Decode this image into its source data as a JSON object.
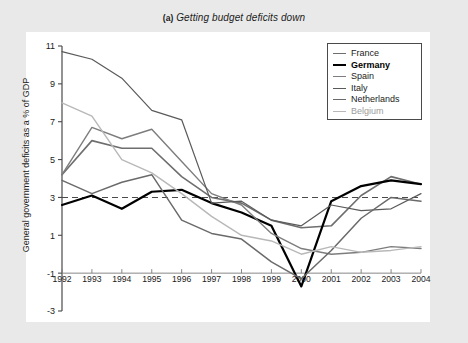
{
  "figure": {
    "panel_label": "(a)",
    "title": "Getting budget deficits down",
    "background_color": "#e9e9e9",
    "plot_background_color": "#ffffff"
  },
  "legend": {
    "position": "top-right",
    "entries": [
      {
        "label": "France",
        "color": "#6e6e6e",
        "width": 1.6,
        "icon": "line-swatch-icon"
      },
      {
        "label": "Germany",
        "color": "#000000",
        "width": 2.2,
        "icon": "line-swatch-icon"
      },
      {
        "label": "Spain",
        "color": "#7d7d7d",
        "width": 1.4,
        "icon": "line-swatch-icon"
      },
      {
        "label": "Italy",
        "color": "#5a5a5a",
        "width": 1.2,
        "icon": "line-swatch-icon"
      },
      {
        "label": "Netherlands",
        "color": "#6a6a6a",
        "width": 1.5,
        "icon": "line-swatch-icon"
      },
      {
        "label": "Belgium",
        "color": "#b8b8b8",
        "width": 1.4,
        "icon": "line-swatch-icon"
      }
    ]
  },
  "chart_data": {
    "type": "line",
    "title": "(a)  Getting budget deficits down",
    "xlabel": "",
    "ylabel": "General government deficits as a % of GDP",
    "x": [
      1992,
      1993,
      1994,
      1995,
      1996,
      1997,
      1998,
      1999,
      2000,
      2001,
      2002,
      2003,
      2004
    ],
    "xtick_labels": [
      "1992",
      "1993",
      "1994",
      "1995",
      "1996",
      "1997",
      "1998",
      "1999",
      "2000",
      "2001",
      "2002",
      "2003",
      "2004"
    ],
    "ytick_labels": [
      "11",
      "9",
      "7",
      "5",
      "3",
      "1",
      "-1",
      "-3"
    ],
    "ytick_values": [
      11,
      9,
      7,
      5,
      3,
      1,
      -1,
      -3
    ],
    "ylim": [
      -3,
      11
    ],
    "xlim": [
      1992,
      2004
    ],
    "grid": false,
    "reference_line": {
      "value": 3,
      "style": "dashed",
      "color": "#4a4a4a",
      "label": ""
    },
    "legend_position": "top-right",
    "series": [
      {
        "name": "France",
        "color": "#6e6e6e",
        "values": [
          4.2,
          6.0,
          5.6,
          5.6,
          4.1,
          3.0,
          2.7,
          1.8,
          1.4,
          1.5,
          3.1,
          4.1,
          3.7
        ]
      },
      {
        "name": "Germany",
        "color": "#000000",
        "values": [
          2.6,
          3.1,
          2.4,
          3.3,
          3.4,
          2.7,
          2.2,
          1.5,
          -1.7,
          2.8,
          3.6,
          3.9,
          3.7
        ]
      },
      {
        "name": "Spain",
        "color": "#7d7d7d",
        "values": [
          4.2,
          6.7,
          6.1,
          6.6,
          4.9,
          3.2,
          2.6,
          1.1,
          0.3,
          0.0,
          0.1,
          0.4,
          0.3
        ]
      },
      {
        "name": "Italy",
        "color": "#5a5a5a",
        "values": [
          10.7,
          10.3,
          9.3,
          7.6,
          7.1,
          2.7,
          2.8,
          1.8,
          1.5,
          2.6,
          2.3,
          2.4,
          3.2
        ]
      },
      {
        "name": "Netherlands",
        "color": "#6a6a6a",
        "values": [
          3.9,
          3.2,
          3.8,
          4.2,
          1.8,
          1.1,
          0.8,
          -0.4,
          -1.3,
          0.2,
          1.9,
          3.0,
          2.8
        ]
      },
      {
        "name": "Belgium",
        "color": "#b8b8b8",
        "values": [
          8.0,
          7.3,
          5.0,
          4.3,
          3.2,
          2.0,
          1.0,
          0.7,
          0.0,
          0.4,
          0.1,
          0.2,
          0.4
        ]
      }
    ]
  }
}
